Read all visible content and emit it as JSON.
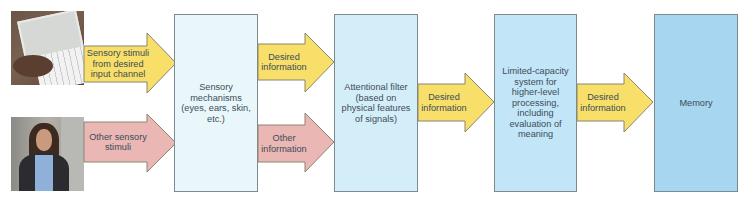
{
  "colors": {
    "yellow_arrow": "#f7df6a",
    "pink_arrow": "#eab7b5",
    "arrow_stroke": "#8a8670",
    "box_sensory": "#e9f7fb",
    "box_attentional": "#d4eef9",
    "box_limited": "#c2e6f7",
    "box_memory": "#a6d6f0",
    "text": "#3d4c57"
  },
  "photos": {
    "top": {
      "description": "hand typing a text message on a phone"
    },
    "bottom": {
      "description": "woman walking while using phone in crowd"
    }
  },
  "inputs": {
    "desired": "Sensory stimuli from desired input channel",
    "other": "Other sensory stimuli"
  },
  "boxes": {
    "sensory": "Sensory mechanisms (eyes, ears, skin, etc.)",
    "attentional": "Attentional filter (based on physical features of signals)",
    "limited": "Limited-capacity system for higher-level processing, including evaluation of meaning",
    "memory": "Memory"
  },
  "arrows": {
    "desired_1": "Desired information",
    "other_1": "Other information",
    "desired_2": "Desired information",
    "desired_3": "Desired information"
  }
}
